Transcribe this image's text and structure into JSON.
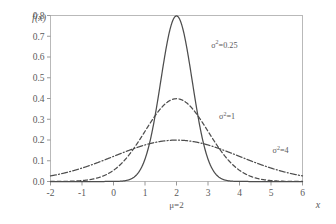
{
  "chart_data": {
    "type": "line",
    "title": "",
    "subtitle": "",
    "xlabel": "x",
    "ylabel": "f(x)",
    "xlim": [
      -2,
      6
    ],
    "ylim": [
      0.0,
      0.8
    ],
    "grid": false,
    "legend_position": "inline-annotations",
    "x_ticks": [
      "-2",
      "-1",
      "0",
      "1",
      "2",
      "3",
      "4",
      "5",
      "6"
    ],
    "x_tick_values": [
      -2,
      -1,
      0,
      1,
      2,
      3,
      4,
      5,
      6
    ],
    "y_ticks": [
      "0.0",
      "0.1",
      "0.2",
      "0.3",
      "0.4",
      "0.5",
      "0.6",
      "0.7",
      "0.8"
    ],
    "y_tick_values": [
      0.0,
      0.1,
      0.2,
      0.3,
      0.4,
      0.5,
      0.6,
      0.7,
      0.8
    ],
    "mean_annotation": "μ=2",
    "mean_value": 2,
    "series": [
      {
        "name": "σ²=0.25",
        "label_base": "σ",
        "label_sup": "2",
        "label_value": "=0.25",
        "variance": 0.25,
        "sigma": 0.5,
        "mean": 2,
        "peak": 0.798,
        "style": "solid",
        "color": "#4d4d4d",
        "label_x": 3.1,
        "label_y": 0.645
      },
      {
        "name": "σ²=1",
        "label_base": "σ",
        "label_sup": "2",
        "label_value": "=1",
        "variance": 1,
        "sigma": 1,
        "mean": 2,
        "peak": 0.399,
        "style": "dashed",
        "color": "#4d4d4d",
        "label_x": 3.35,
        "label_y": 0.3
      },
      {
        "name": "σ²=4",
        "label_base": "σ",
        "label_sup": "2",
        "label_value": "=4",
        "variance": 4,
        "sigma": 2,
        "mean": 2,
        "peak": 0.199,
        "style": "dashdot",
        "color": "#4d4d4d",
        "label_x": 5.05,
        "label_y": 0.135
      }
    ],
    "background_color": "#ffffff",
    "frame_color": "#b9b9b9",
    "text_color": "#5a5a5a"
  }
}
